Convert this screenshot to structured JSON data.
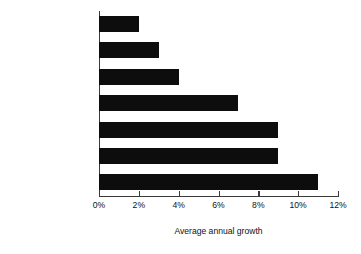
{
  "chart_data": {
    "type": "bar",
    "orientation": "horizontal",
    "title": "",
    "xlabel": "Average annual growth",
    "ylabel": "",
    "categories": [
      "W. Europe",
      "Japan",
      "North America",
      "South America",
      "Africa/Mid. East",
      "Asia/Pacific",
      "Eastern Europe"
    ],
    "values": [
      2,
      3,
      4,
      7,
      9,
      9,
      11
    ],
    "value_labels": [
      "2%",
      "3%",
      "4%",
      "7%",
      "9%",
      "9%",
      "11%"
    ],
    "xlim": [
      0,
      12
    ],
    "x_tick_labels": [
      "0%",
      "2%",
      "4%",
      "6%",
      "8%",
      "10%",
      "12%"
    ],
    "x_tick_values": [
      0,
      2,
      4,
      6,
      8,
      10,
      12
    ],
    "grid": false,
    "legend": false,
    "bar_color": "#0d0d0d",
    "axis_color": "#3a3a3a",
    "background_color": "#ffffff"
  }
}
